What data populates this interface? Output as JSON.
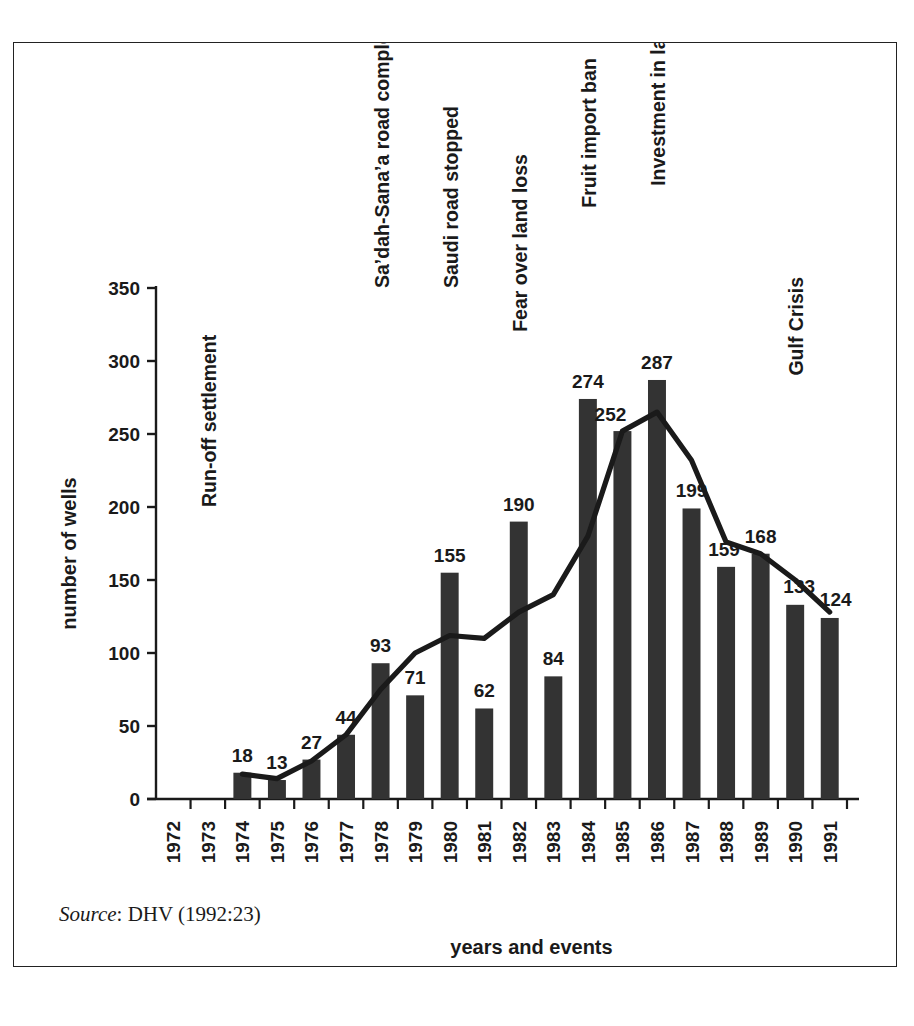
{
  "figure": {
    "source_prefix": "Source",
    "source_rest": ": DHV (1992:23)"
  },
  "chart_data": {
    "type": "bar",
    "title": "",
    "xlabel": "years and events",
    "ylabel": "number of wells",
    "ylim": [
      0,
      350
    ],
    "yticks": [
      0,
      50,
      100,
      150,
      200,
      250,
      300,
      350
    ],
    "grid": false,
    "legend": "none",
    "categories": [
      "1972",
      "1973",
      "1974",
      "1975",
      "1976",
      "1977",
      "1978",
      "1979",
      "1980",
      "1981",
      "1982",
      "1983",
      "1984",
      "1985",
      "1986",
      "1987",
      "1988",
      "1989",
      "1990",
      "1991"
    ],
    "series": [
      {
        "name": "number of wells",
        "type": "bar",
        "color": "#333333",
        "values": [
          null,
          null,
          18,
          13,
          27,
          44,
          93,
          71,
          155,
          62,
          190,
          84,
          274,
          252,
          287,
          199,
          159,
          168,
          133,
          124
        ]
      },
      {
        "name": "trend",
        "type": "line",
        "color": "#1a1a1a",
        "values": [
          null,
          null,
          17,
          14,
          26,
          44,
          75,
          100,
          112,
          110,
          128,
          140,
          180,
          252,
          265,
          232,
          176,
          168,
          150,
          128
        ]
      }
    ],
    "data_labels": [
      "",
      "",
      "18",
      "13",
      "27",
      "44",
      "93",
      "71",
      "155",
      "62",
      "190",
      "84",
      "274",
      "252",
      "287",
      "199",
      "159",
      "168",
      "133",
      "124"
    ],
    "annotations": [
      {
        "text": "Run-off settlement",
        "category": "1973",
        "top_value": 200
      },
      {
        "text": "Sa’dah-Sana’a road completed",
        "category": "1978",
        "top_value": 350
      },
      {
        "text": "Saudi road stopped",
        "category": "1980",
        "top_value": 350
      },
      {
        "text": "Fear over land loss",
        "category": "1982",
        "top_value": 320
      },
      {
        "text": "Fruit import ban",
        "category": "1984",
        "top_value": 405
      },
      {
        "text": "Investment in land",
        "category": "1986",
        "top_value": 420
      },
      {
        "text": "Gulf Crisis",
        "category": "1990",
        "top_value": 290
      }
    ]
  }
}
